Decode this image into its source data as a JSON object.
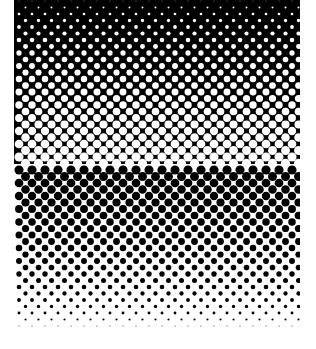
{
  "pattern": {
    "type": "halftone-gradient",
    "area": {
      "x": 14,
      "y": 0,
      "width": 286,
      "height": 328
    },
    "colors": {
      "dark": "#000000",
      "light": "#ffffff"
    },
    "col_spacing": 13,
    "row_spacing": 6.5,
    "max_radius": 6.2,
    "direction": "top-dark-to-bottom-light"
  }
}
